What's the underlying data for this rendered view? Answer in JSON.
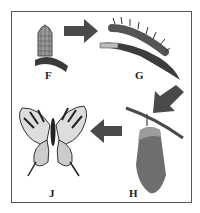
{
  "diagram": {
    "type": "life-cycle",
    "stages": [
      {
        "id": "F",
        "label": "F",
        "depicts": "egg on leaf"
      },
      {
        "id": "G",
        "label": "G",
        "depicts": "caterpillar on leaf"
      },
      {
        "id": "H",
        "label": "H",
        "depicts": "chrysalis hanging from branch"
      },
      {
        "id": "J",
        "label": "J",
        "depicts": "butterfly"
      }
    ],
    "arrows": [
      {
        "from": "F",
        "to": "G"
      },
      {
        "from": "G",
        "to": "H"
      },
      {
        "from": "H",
        "to": "J"
      }
    ],
    "colors": {
      "arrow": "#4a4a4a",
      "outline": "#555555"
    }
  }
}
